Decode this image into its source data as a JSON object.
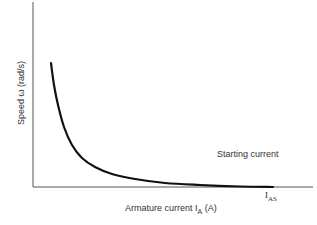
{
  "chart_data": {
    "type": "line",
    "title": "",
    "xlabel": "Armature current I_A (A)",
    "ylabel": "Speed ω (rad/s)",
    "grid": false,
    "legend": null,
    "x_ticks": [
      "I_AS"
    ],
    "y_ticks": [],
    "annotations": [
      "Starting current"
    ],
    "series": [
      {
        "name": "Speed vs armature current",
        "description": "hyperbolic decay; speed falls as current rises, reaching zero at starting current I_AS",
        "points_px": [
          [
            51,
            63
          ],
          [
            54,
            85
          ],
          [
            58,
            105
          ],
          [
            64,
            127
          ],
          [
            72,
            145
          ],
          [
            82,
            158
          ],
          [
            95,
            167
          ],
          [
            112,
            174
          ],
          [
            135,
            179
          ],
          [
            165,
            183
          ],
          [
            200,
            185
          ],
          [
            240,
            186.5
          ],
          [
            273,
            187
          ]
        ]
      }
    ],
    "colors": {
      "curve": "#111111",
      "axis": "#555555"
    }
  },
  "labels": {
    "ylabel_text": "Speed ω (rad/s)",
    "xlabel_main": "Armature current I",
    "xlabel_sub": "A",
    "xlabel_unit": " (A)",
    "annotation": "Starting current",
    "ias_main": "I",
    "ias_sub": "AS"
  }
}
